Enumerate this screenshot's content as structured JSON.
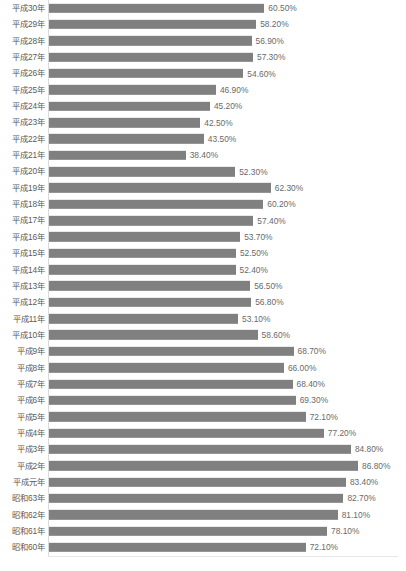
{
  "chart_data": {
    "type": "bar",
    "orientation": "horizontal",
    "title": "",
    "subtitle": "",
    "xlabel": "",
    "ylabel": "",
    "grid": false,
    "legend": "none",
    "xlim": [
      0,
      86.8
    ],
    "value_suffix": "%",
    "bar_color": "#808080",
    "axis_color": "#d9d9d9",
    "label_color": "#5a5a5a",
    "categories": [
      "平成30年",
      "平成29年",
      "平成28年",
      "平成27年",
      "平成26年",
      "平成25年",
      "平成24年",
      "平成23年",
      "平成22年",
      "平成21年",
      "平成20年",
      "平成19年",
      "平成18年",
      "平成17年",
      "平成16年",
      "平成15年",
      "平成14年",
      "平成13年",
      "平成12年",
      "平成11年",
      "平成10年",
      "平成9年",
      "平成8年",
      "平成7年",
      "平成6年",
      "平成5年",
      "平成4年",
      "平成3年",
      "平成2年",
      "平成元年",
      "昭和63年",
      "昭和62年",
      "昭和61年",
      "昭和60年"
    ],
    "values": [
      60.5,
      58.2,
      56.9,
      57.3,
      54.6,
      46.9,
      45.2,
      42.5,
      43.5,
      38.4,
      52.3,
      62.3,
      60.2,
      57.4,
      53.7,
      52.5,
      52.4,
      56.5,
      56.8,
      53.1,
      58.6,
      68.7,
      66.0,
      68.4,
      69.3,
      72.1,
      77.2,
      84.8,
      86.8,
      83.4,
      82.7,
      81.1,
      78.1,
      72.1
    ],
    "value_labels": [
      "60.50%",
      "58.20%",
      "56.90%",
      "57.30%",
      "54.60%",
      "46.90%",
      "45.20%",
      "42.50%",
      "43.50%",
      "38.40%",
      "52.30%",
      "62.30%",
      "60.20%",
      "57.40%",
      "53.70%",
      "52.50%",
      "52.40%",
      "56.50%",
      "56.80%",
      "53.10%",
      "58.60%",
      "68.70%",
      "66.00%",
      "68.40%",
      "69.30%",
      "72.10%",
      "77.20%",
      "84.80%",
      "86.80%",
      "83.40%",
      "82.70%",
      "81.10%",
      "78.10%",
      "72.10%"
    ]
  }
}
